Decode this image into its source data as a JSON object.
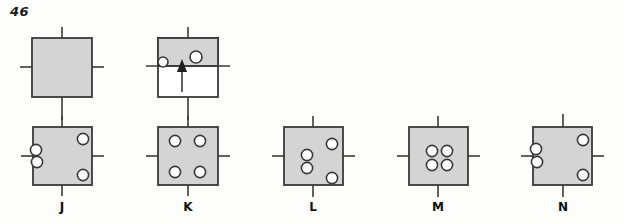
{
  "page": {
    "question_number": "46",
    "width": 624,
    "height": 224,
    "background_color": "#fdfdfc"
  },
  "style": {
    "box_fill": "#d4d4d4",
    "box_stroke": "#3a3a3a",
    "line_color": "#3a3a3a",
    "circle_fill": "#ffffff",
    "circle_stroke": "#3a3a3a",
    "white_fill": "#ffffff",
    "text_color": "#111111"
  },
  "stimulus": {
    "name": "stimulus-row",
    "figures": [
      {
        "id": "stimulus-figure-1",
        "type": "plain-box",
        "x": 32,
        "y": 38,
        "w": 60,
        "h": 59,
        "fill": "gray",
        "ticks": [
          "top",
          "bottom",
          "left",
          "right"
        ],
        "circles": []
      },
      {
        "id": "stimulus-figure-2",
        "type": "half-shaded-box-with-arrow",
        "x": 158,
        "y": 38,
        "w": 60,
        "h": 59,
        "shaded_fraction": 0.47,
        "fill": "gray-top-white-bottom",
        "ticks": [
          "top",
          "bottom"
        ],
        "divider_line": "horizontal-full-width",
        "arrow": {
          "direction": "up",
          "from_y": 92,
          "to_y": 62
        },
        "circles": [
          {
            "cx": 161,
            "cy": 63,
            "r": 5
          },
          {
            "cx": 196,
            "cy": 58,
            "r": 6
          }
        ]
      }
    ],
    "connectors": [
      {
        "from": "stimulus-figure-1",
        "to": "option-J",
        "orientation": "vertical"
      },
      {
        "from": "stimulus-figure-2",
        "to": "option-K",
        "orientation": "vertical"
      }
    ]
  },
  "options": [
    {
      "id": "option-J",
      "label": "J",
      "x": 33,
      "y": 127,
      "w": 59,
      "h": 58,
      "label_x": 42,
      "ticks": [
        "top",
        "bottom",
        "left",
        "right"
      ],
      "circles": [
        {
          "cx": 83,
          "cy": 139,
          "r": 6
        },
        {
          "cx": 36,
          "cy": 151,
          "r": 6
        },
        {
          "cx": 37,
          "cy": 162,
          "r": 6
        },
        {
          "cx": 83,
          "cy": 175,
          "r": 6
        }
      ]
    },
    {
      "id": "option-K",
      "label": "K",
      "x": 158,
      "y": 127,
      "w": 60,
      "h": 58,
      "label_x": 168,
      "ticks": [
        "top",
        "bottom",
        "left",
        "right"
      ],
      "circles": [
        {
          "cx": 175,
          "cy": 141,
          "r": 6
        },
        {
          "cx": 200,
          "cy": 141,
          "r": 6
        },
        {
          "cx": 175,
          "cy": 172,
          "r": 6
        },
        {
          "cx": 200,
          "cy": 172,
          "r": 6
        }
      ]
    },
    {
      "id": "option-L",
      "label": "L",
      "x": 284,
      "y": 127,
      "w": 59,
      "h": 58,
      "label_x": 293,
      "ticks": [
        "top",
        "bottom",
        "left",
        "right"
      ],
      "circles": [
        {
          "cx": 332,
          "cy": 144,
          "r": 6
        },
        {
          "cx": 307,
          "cy": 155,
          "r": 6
        },
        {
          "cx": 307,
          "cy": 168,
          "r": 6
        },
        {
          "cx": 332,
          "cy": 178,
          "r": 6
        }
      ]
    },
    {
      "id": "option-M",
      "label": "M",
      "x": 409,
      "y": 127,
      "w": 59,
      "h": 58,
      "label_x": 418,
      "ticks": [
        "top",
        "bottom",
        "left",
        "right"
      ],
      "circles": [
        {
          "cx": 432,
          "cy": 151,
          "r": 6
        },
        {
          "cx": 446,
          "cy": 151,
          "r": 6
        },
        {
          "cx": 432,
          "cy": 165,
          "r": 6
        },
        {
          "cx": 446,
          "cy": 165,
          "r": 6
        }
      ]
    },
    {
      "id": "option-N",
      "label": "N",
      "x": 533,
      "y": 127,
      "w": 59,
      "h": 58,
      "label_x": 543,
      "ticks": [
        "top",
        "bottom",
        "left",
        "right"
      ],
      "circles": [
        {
          "cx": 583,
          "cy": 140,
          "r": 6
        },
        {
          "cx": 536,
          "cy": 150,
          "r": 6
        },
        {
          "cx": 537,
          "cy": 162,
          "r": 6
        },
        {
          "cx": 583,
          "cy": 175,
          "r": 6
        }
      ]
    }
  ]
}
